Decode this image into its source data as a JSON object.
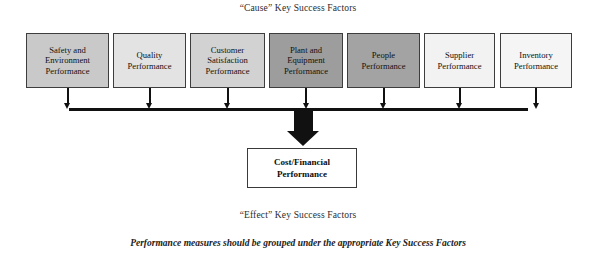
{
  "diagram": {
    "cause_heading": "“Cause” Key Success Factors",
    "effect_heading": "“Effect” Key Success Factors",
    "caption": "Performance measures should be grouped under the appropriate Key Success Factors",
    "cause_factors": [
      {
        "label": "Safety and Environment Performance",
        "fill": "#c9c9c9",
        "x": 26,
        "width": 83
      },
      {
        "label": "Quality Performance",
        "fill": "#e3e3e3",
        "x": 113,
        "width": 73
      },
      {
        "label": "Customer Satisfaction Performance",
        "fill": "#d2d2d2",
        "x": 190,
        "width": 75
      },
      {
        "label": "Plant and Equipment Performance",
        "fill": "#9d9d9d",
        "x": 269,
        "width": 74
      },
      {
        "label": "People Performance",
        "fill": "#a3a3a3",
        "x": 347,
        "width": 73
      },
      {
        "label": "Supplier Performance",
        "fill": "#f2f2f2",
        "x": 424,
        "width": 71
      },
      {
        "label": "Inventory Performance",
        "fill": "#f5f5f5",
        "x": 500,
        "width": 72
      }
    ],
    "effect_box": {
      "label": "Cost/Financial Performance",
      "fill": "#ffffff"
    },
    "line_color": "#111111",
    "border_color": "#3d3d3d"
  }
}
